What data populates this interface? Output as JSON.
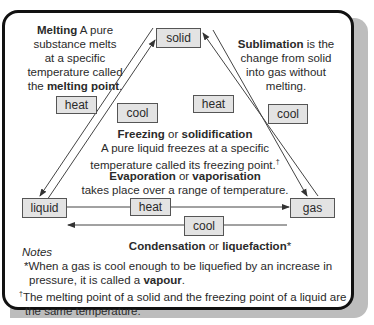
{
  "states": {
    "solid": "solid",
    "liquid": "liquid",
    "gas": "gas"
  },
  "labels": {
    "melting_heat": "heat",
    "freezing_cool": "cool",
    "sublimation_heat": "heat",
    "deposition_cool": "cool",
    "evaporation_heat": "heat",
    "condensation_cool": "cool"
  },
  "melting": {
    "term": "Melting",
    "text1": " A pure",
    "line2": "substance melts",
    "line3": "at a specific",
    "line4": "temperature called",
    "line5_pre": "the ",
    "line5_bold": "melting point",
    "line5_post": "."
  },
  "sublimation": {
    "term": "Sublimation",
    "text1": " is the",
    "line2": "change from solid",
    "line3": "into gas without",
    "line4": "melting."
  },
  "freezing": {
    "term1": "Freezing",
    "or": " or ",
    "term2": "solidification",
    "line2": "A pure liquid freezes at a specific",
    "line3": "temperature called its freezing point.",
    "dagger": "†"
  },
  "evaporation": {
    "term1": "Evaporation",
    "or": " or ",
    "term2": "vaporisation",
    "line2": "takes place over a range of temperature."
  },
  "condensation": {
    "term1": "Condensation",
    "or": " or ",
    "term2": "liquefaction",
    "star": "*"
  },
  "notes": {
    "heading": "Notes",
    "note1_line1": "*When a gas is cool enough to be liquefied by an increase in",
    "note1_line2_pre": "pressure, it is called a ",
    "note1_line2_bold": "vapour",
    "note1_line2_post": ".",
    "note2_mark": "†",
    "note2_line1": "The melting point of a solid and the freezing point of a liquid are",
    "note2_line2": "the same temperature."
  },
  "colors": {
    "box_fill": "#e3e3e3",
    "border": "#111111",
    "shadow": "#bdbdbd"
  }
}
